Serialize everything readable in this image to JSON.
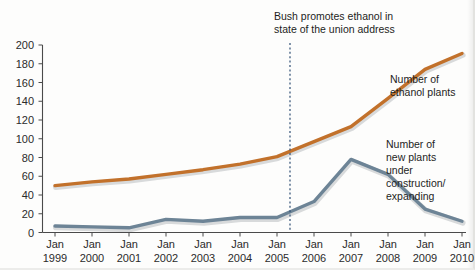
{
  "chart_data": {
    "type": "line",
    "title": "",
    "subtitle": "",
    "xlabel": "",
    "ylabel": "",
    "ylim": [
      0,
      200
    ],
    "ytick_step": 20,
    "grid": false,
    "legend_position": "inline-right",
    "categories": [
      "Jan 1999",
      "Jan 2000",
      "Jan 2001",
      "Jan 2002",
      "Jan 2003",
      "Jan 2004",
      "Jan 2005",
      "Jan 2006",
      "Jan 2007",
      "Jan 2008",
      "Jan 2009",
      "Jan 2010"
    ],
    "x_tick_lines": [
      {
        "top": "Jan",
        "bottom": "1999"
      },
      {
        "top": "Jan",
        "bottom": "2000"
      },
      {
        "top": "Jan",
        "bottom": "2001"
      },
      {
        "top": "Jan",
        "bottom": "2002"
      },
      {
        "top": "Jan",
        "bottom": "2003"
      },
      {
        "top": "Jan",
        "bottom": "2004"
      },
      {
        "top": "Jan",
        "bottom": "2005"
      },
      {
        "top": "Jan",
        "bottom": "2006"
      },
      {
        "top": "Jan",
        "bottom": "2007"
      },
      {
        "top": "Jan",
        "bottom": "2008"
      },
      {
        "top": "Jan",
        "bottom": "2009"
      },
      {
        "top": "Jan",
        "bottom": "2010"
      }
    ],
    "y_tick_labels": [
      "0",
      "20",
      "40",
      "60",
      "80",
      "100",
      "120",
      "140",
      "160",
      "180",
      "200"
    ],
    "series": [
      {
        "name": "Number of ethanol plants",
        "color": "#c2712b",
        "values": [
          50,
          54,
          57,
          62,
          67,
          73,
          81,
          97,
          113,
          143,
          174,
          191
        ]
      },
      {
        "name": "Number of new plants under construction/expanding",
        "color": "#6d8496",
        "values": [
          7,
          6,
          5,
          14,
          12,
          16,
          16,
          33,
          78,
          62,
          25,
          12
        ]
      }
    ],
    "annotations": [
      {
        "id": "bush-ethanol-event",
        "line1": "Bush promotes ethanol in",
        "line2": "state of the union address",
        "at_category": "Jan 2006",
        "marker_color": "#2f4f74",
        "marker_style": "dotted-vertical-line"
      }
    ],
    "series_labels": [
      {
        "id": "ethanol-plants-label",
        "lines": [
          "Number of",
          "ethanol plants"
        ]
      },
      {
        "id": "new-plants-label",
        "lines": [
          "Number of",
          "new plants",
          "under",
          "construction/",
          "expanding"
        ]
      }
    ]
  }
}
